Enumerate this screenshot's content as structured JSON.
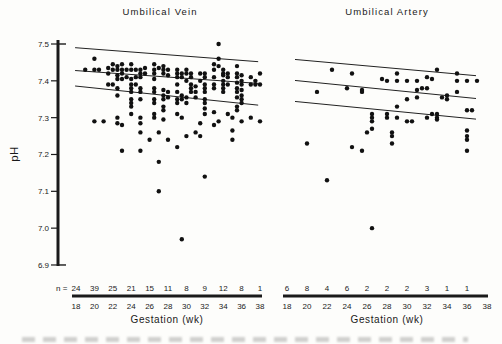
{
  "figure": {
    "background": "#fdfdfb",
    "ink": "#1a1a1a",
    "ylabel": "pH",
    "n_prefix": "n =",
    "panels": [
      {
        "title": "Umbilical Vein",
        "xlabel": "Gestation (wk)"
      },
      {
        "title": "Umbilical Artery",
        "xlabel": "Gestation (wk)"
      }
    ]
  },
  "chart_data": [
    {
      "type": "scatter",
      "title": "Umbilical Vein",
      "xlabel": "Gestation (wk)",
      "ylabel": "pH",
      "xlim": [
        18,
        38
      ],
      "ylim": [
        6.9,
        7.5
      ],
      "grid": false,
      "x_ticks": [
        18,
        20,
        22,
        24,
        26,
        28,
        30,
        32,
        34,
        36,
        38
      ],
      "y_tick_labels": [
        "7.5",
        "7.4",
        "7.3",
        "7.2",
        "7.1",
        "7.0",
        "6.9"
      ],
      "n_label": "n =",
      "n_per_tick": [
        24,
        39,
        25,
        21,
        15,
        11,
        8,
        9,
        12,
        8,
        1
      ],
      "reference_lines": [
        {
          "name": "upper limit",
          "x": [
            17.9,
            37.8
          ],
          "y": [
            7.49,
            7.452
          ]
        },
        {
          "name": "mean",
          "x": [
            17.9,
            37.8
          ],
          "y": [
            7.428,
            7.393
          ]
        },
        {
          "name": "lower limit",
          "x": [
            17.9,
            37.8
          ],
          "y": [
            7.386,
            7.334
          ]
        }
      ],
      "points": [
        [
          19,
          7.43
        ],
        [
          20,
          7.46
        ],
        [
          20,
          7.43
        ],
        [
          20,
          7.29
        ],
        [
          20.5,
          7.43
        ],
        [
          21,
          7.29
        ],
        [
          21.5,
          7.435
        ],
        [
          21.5,
          7.42
        ],
        [
          21.5,
          7.39
        ],
        [
          22,
          7.445
        ],
        [
          22,
          7.43
        ],
        [
          22,
          7.39
        ],
        [
          22.5,
          7.44
        ],
        [
          22.5,
          7.43
        ],
        [
          22.5,
          7.415
        ],
        [
          22.5,
          7.405
        ],
        [
          22.5,
          7.38
        ],
        [
          22.5,
          7.36
        ],
        [
          22.5,
          7.3
        ],
        [
          22.5,
          7.285
        ],
        [
          23,
          7.445
        ],
        [
          23,
          7.43
        ],
        [
          23,
          7.42
        ],
        [
          23,
          7.405
        ],
        [
          23,
          7.28
        ],
        [
          23,
          7.21
        ],
        [
          23.5,
          7.43
        ],
        [
          23.5,
          7.41
        ],
        [
          24,
          7.445
        ],
        [
          24,
          7.43
        ],
        [
          24,
          7.405
        ],
        [
          24,
          7.39
        ],
        [
          24,
          7.38
        ],
        [
          24,
          7.37
        ],
        [
          24,
          7.35
        ],
        [
          24,
          7.34
        ],
        [
          24,
          7.33
        ],
        [
          24,
          7.31
        ],
        [
          24.5,
          7.43
        ],
        [
          24.5,
          7.41
        ],
        [
          24.5,
          7.39
        ],
        [
          25,
          7.43
        ],
        [
          25,
          7.42
        ],
        [
          25,
          7.41
        ],
        [
          25,
          7.38
        ],
        [
          25,
          7.37
        ],
        [
          25,
          7.35
        ],
        [
          25,
          7.3
        ],
        [
          25,
          7.285
        ],
        [
          25,
          7.26
        ],
        [
          25,
          7.21
        ],
        [
          25.5,
          7.435
        ],
        [
          25.5,
          7.42
        ],
        [
          26,
          7.24
        ],
        [
          26.5,
          7.445
        ],
        [
          26.5,
          7.43
        ],
        [
          26.5,
          7.42
        ],
        [
          26.5,
          7.405
        ],
        [
          26.5,
          7.38
        ],
        [
          26.5,
          7.37
        ],
        [
          26.5,
          7.35
        ],
        [
          26.5,
          7.34
        ],
        [
          26.5,
          7.31
        ],
        [
          26.5,
          7.3
        ],
        [
          27,
          7.435
        ],
        [
          27,
          7.26
        ],
        [
          27,
          7.18
        ],
        [
          27,
          7.1
        ],
        [
          27.5,
          7.44
        ],
        [
          27.5,
          7.43
        ],
        [
          27.5,
          7.42
        ],
        [
          27.5,
          7.375
        ],
        [
          27.5,
          7.36
        ],
        [
          27.5,
          7.35
        ],
        [
          27.5,
          7.33
        ],
        [
          27.5,
          7.32
        ],
        [
          27.5,
          7.295
        ],
        [
          28,
          7.43
        ],
        [
          28,
          7.415
        ],
        [
          28,
          7.37
        ],
        [
          28,
          7.355
        ],
        [
          28,
          7.24
        ],
        [
          29,
          7.43
        ],
        [
          29,
          7.42
        ],
        [
          29,
          7.41
        ],
        [
          29,
          7.39
        ],
        [
          29,
          7.37
        ],
        [
          29,
          7.35
        ],
        [
          29,
          7.34
        ],
        [
          29,
          7.31
        ],
        [
          29,
          7.22
        ],
        [
          29.5,
          7.42
        ],
        [
          29.5,
          7.41
        ],
        [
          29.5,
          7.36
        ],
        [
          29.5,
          7.35
        ],
        [
          29.5,
          7.3
        ],
        [
          29.5,
          6.97
        ],
        [
          30,
          7.43
        ],
        [
          30,
          7.42
        ],
        [
          30,
          7.4
        ],
        [
          30,
          7.355
        ],
        [
          30,
          7.34
        ],
        [
          30,
          7.25
        ],
        [
          30.5,
          7.42
        ],
        [
          30.5,
          7.41
        ],
        [
          30.5,
          7.39
        ],
        [
          30.5,
          7.38
        ],
        [
          30.5,
          7.37
        ],
        [
          31,
          7.385
        ],
        [
          31,
          7.37
        ],
        [
          31,
          7.355
        ],
        [
          31,
          7.26
        ],
        [
          31.5,
          7.42
        ],
        [
          31.5,
          7.4
        ],
        [
          31.5,
          7.285
        ],
        [
          31.5,
          7.25
        ],
        [
          32,
          7.42
        ],
        [
          32,
          7.41
        ],
        [
          32,
          7.39
        ],
        [
          32,
          7.38
        ],
        [
          32,
          7.37
        ],
        [
          32,
          7.35
        ],
        [
          32,
          7.34
        ],
        [
          32,
          7.325
        ],
        [
          32,
          7.31
        ],
        [
          32,
          7.14
        ],
        [
          33,
          7.445
        ],
        [
          33,
          7.43
        ],
        [
          33,
          7.41
        ],
        [
          33,
          7.39
        ],
        [
          33,
          7.38
        ],
        [
          33,
          7.315
        ],
        [
          33,
          7.28
        ],
        [
          33.5,
          7.5
        ],
        [
          33.5,
          7.46
        ],
        [
          33.5,
          7.44
        ],
        [
          33.5,
          7.29
        ],
        [
          34,
          7.43
        ],
        [
          34,
          7.42
        ],
        [
          34,
          7.415
        ],
        [
          34,
          7.4
        ],
        [
          34,
          7.39
        ],
        [
          34,
          7.38
        ],
        [
          34,
          7.37
        ],
        [
          34.5,
          7.42
        ],
        [
          34.5,
          7.41
        ],
        [
          34.5,
          7.39
        ],
        [
          34.5,
          7.31
        ],
        [
          35,
          7.3
        ],
        [
          35,
          7.265
        ],
        [
          35,
          7.24
        ],
        [
          35.5,
          7.44
        ],
        [
          35.5,
          7.42
        ],
        [
          35.5,
          7.41
        ],
        [
          35.5,
          7.395
        ],
        [
          35.5,
          7.38
        ],
        [
          35.5,
          7.37
        ],
        [
          35.5,
          7.355
        ],
        [
          35.5,
          7.33
        ],
        [
          35.5,
          7.32
        ],
        [
          36,
          7.415
        ],
        [
          36,
          7.4
        ],
        [
          36,
          7.39
        ],
        [
          36,
          7.375
        ],
        [
          36,
          7.36
        ],
        [
          36,
          7.35
        ],
        [
          36,
          7.34
        ],
        [
          36,
          7.29
        ],
        [
          37,
          7.41
        ],
        [
          37,
          7.39
        ],
        [
          37,
          7.3
        ],
        [
          37.5,
          7.4
        ],
        [
          37.5,
          7.39
        ],
        [
          38,
          7.42
        ],
        [
          38,
          7.39
        ],
        [
          38,
          7.29
        ]
      ]
    },
    {
      "type": "scatter",
      "title": "Umbilical Artery",
      "xlabel": "Gestation (wk)",
      "ylabel": "pH",
      "xlim": [
        18,
        38
      ],
      "ylim": [
        6.9,
        7.5
      ],
      "grid": false,
      "x_ticks": [
        18,
        20,
        22,
        24,
        26,
        28,
        30,
        32,
        34,
        36,
        38
      ],
      "y_tick_labels": [
        "7.5",
        "7.4",
        "7.3",
        "7.2",
        "7.1",
        "7.0",
        "6.9"
      ],
      "n_label": "",
      "n_per_tick": [
        6,
        8,
        4,
        6,
        2,
        2,
        2,
        3,
        1,
        1
      ],
      "reference_lines": [
        {
          "name": "upper limit",
          "x": [
            18.8,
            36.9
          ],
          "y": [
            7.458,
            7.414
          ]
        },
        {
          "name": "mean",
          "x": [
            18.8,
            36.9
          ],
          "y": [
            7.401,
            7.352
          ]
        },
        {
          "name": "lower limit",
          "x": [
            18.8,
            36.9
          ],
          "y": [
            7.344,
            7.296
          ]
        }
      ],
      "points": [
        [
          20,
          7.23
        ],
        [
          21,
          7.37
        ],
        [
          22,
          7.13
        ],
        [
          22.5,
          7.43
        ],
        [
          24,
          7.38
        ],
        [
          24.5,
          7.42
        ],
        [
          24.5,
          7.22
        ],
        [
          25.5,
          7.375
        ],
        [
          25.5,
          7.37
        ],
        [
          25.5,
          7.21
        ],
        [
          26,
          7.26
        ],
        [
          26.5,
          7.31
        ],
        [
          26.5,
          7.3
        ],
        [
          26.5,
          7.29
        ],
        [
          26.5,
          7.27
        ],
        [
          26.5,
          7.0
        ],
        [
          27.5,
          7.405
        ],
        [
          28,
          7.4
        ],
        [
          28,
          7.31
        ],
        [
          28,
          7.3
        ],
        [
          28.5,
          7.26
        ],
        [
          28.5,
          7.25
        ],
        [
          28.5,
          7.23
        ],
        [
          29,
          7.42
        ],
        [
          29,
          7.4
        ],
        [
          29,
          7.33
        ],
        [
          29,
          7.3
        ],
        [
          30,
          7.4
        ],
        [
          30,
          7.35
        ],
        [
          30,
          7.29
        ],
        [
          30.5,
          7.29
        ],
        [
          31,
          7.4
        ],
        [
          31,
          7.375
        ],
        [
          31,
          7.355
        ],
        [
          31.5,
          7.38
        ],
        [
          32,
          7.41
        ],
        [
          32,
          7.38
        ],
        [
          32,
          7.3
        ],
        [
          32.5,
          7.405
        ],
        [
          32.5,
          7.31
        ],
        [
          33,
          7.43
        ],
        [
          33,
          7.31
        ],
        [
          33,
          7.3
        ],
        [
          33,
          7.295
        ],
        [
          33.5,
          7.355
        ],
        [
          34,
          7.36
        ],
        [
          34,
          7.35
        ],
        [
          35,
          7.42
        ],
        [
          35,
          7.4
        ],
        [
          35,
          7.37
        ],
        [
          36,
          7.4
        ],
        [
          36,
          7.32
        ],
        [
          36,
          7.265
        ],
        [
          36,
          7.25
        ],
        [
          36,
          7.24
        ],
        [
          36,
          7.21
        ],
        [
          36.5,
          7.32
        ],
        [
          37,
          7.4
        ]
      ]
    }
  ]
}
